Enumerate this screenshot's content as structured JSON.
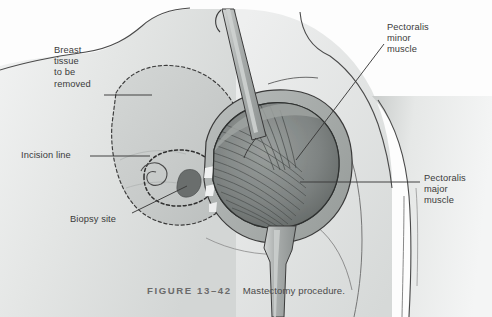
{
  "figure": {
    "number": "FIGURE 13–42",
    "title": "Mastectomy procedure.",
    "domain": "medical-anatomical-illustration"
  },
  "labels": {
    "breast_tissue": "Breast\ntissue\nto be\nremoved",
    "incision_line": "Incision line",
    "biopsy_site": "Biopsy site",
    "pectoralis_minor": "Pectoralis\nminor\nmuscle",
    "pectoralis_major": "Pectoralis\nmajor\nmuscle"
  },
  "colors": {
    "background": "#fdfdfd",
    "skin_light": "#eceded",
    "skin_mid": "#dcdedd",
    "skin_shadow": "#c4c7c6",
    "breast_tissue_fill": "#c9cccb",
    "muscle_mid": "#8e9392",
    "muscle_dark": "#5f6462",
    "muscle_light": "#b2b6b5",
    "instrument": "#a9adac",
    "outline": "#3a3a3a",
    "label_text": "#3b3b3b",
    "caption_text": "#5a5a5a",
    "biopsy_mark": "#6a6e6d"
  },
  "anatomy": {
    "parts": [
      "torso",
      "shoulder",
      "upper-arm",
      "neck",
      "breast-tissue-outline",
      "areola-incision-ellipse",
      "nipple-spiral",
      "biopsy-site-mark",
      "pectoralis-major-muscle",
      "pectoralis-minor-muscle",
      "retracted-skin-flap",
      "upper-retractor-instrument",
      "lower-retractor-instrument"
    ]
  }
}
